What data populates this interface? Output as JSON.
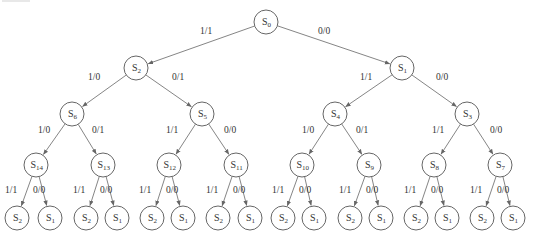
{
  "colors": {
    "stroke": "#666666",
    "edge": "#777777",
    "text": "#333333",
    "background": "#ffffff"
  },
  "node_radius": 12,
  "leaf_radius": 12,
  "nodes": [
    {
      "id": "n0",
      "base": "S",
      "sub": "0",
      "x": 266,
      "y": 22
    },
    {
      "id": "n1",
      "base": "S",
      "sub": "2",
      "x": 136,
      "y": 68
    },
    {
      "id": "n2",
      "base": "S",
      "sub": "1",
      "x": 402,
      "y": 68
    },
    {
      "id": "n3",
      "base": "S",
      "sub": "6",
      "x": 72,
      "y": 114
    },
    {
      "id": "n4",
      "base": "S",
      "sub": "5",
      "x": 202,
      "y": 114
    },
    {
      "id": "n5",
      "base": "S",
      "sub": "4",
      "x": 335,
      "y": 114
    },
    {
      "id": "n6",
      "base": "S",
      "sub": "3",
      "x": 467,
      "y": 114
    },
    {
      "id": "n7",
      "base": "S",
      "sub": "14",
      "x": 36,
      "y": 165
    },
    {
      "id": "n8",
      "base": "S",
      "sub": "13",
      "x": 103,
      "y": 165
    },
    {
      "id": "n9",
      "base": "S",
      "sub": "12",
      "x": 169,
      "y": 165
    },
    {
      "id": "n10",
      "base": "S",
      "sub": "11",
      "x": 236,
      "y": 165
    },
    {
      "id": "n11",
      "base": "S",
      "sub": "10",
      "x": 302,
      "y": 165
    },
    {
      "id": "n12",
      "base": "S",
      "sub": "9",
      "x": 369,
      "y": 165
    },
    {
      "id": "n13",
      "base": "S",
      "sub": "8",
      "x": 434,
      "y": 165
    },
    {
      "id": "n14",
      "base": "S",
      "sub": "7",
      "x": 500,
      "y": 165
    },
    {
      "id": "l0",
      "base": "S",
      "sub": "2",
      "x": 17,
      "y": 218
    },
    {
      "id": "l1",
      "base": "S",
      "sub": "1",
      "x": 50,
      "y": 218
    },
    {
      "id": "l2",
      "base": "S",
      "sub": "2",
      "x": 86,
      "y": 218
    },
    {
      "id": "l3",
      "base": "S",
      "sub": "1",
      "x": 117,
      "y": 218
    },
    {
      "id": "l4",
      "base": "S",
      "sub": "2",
      "x": 152,
      "y": 218
    },
    {
      "id": "l5",
      "base": "S",
      "sub": "1",
      "x": 183,
      "y": 218
    },
    {
      "id": "l6",
      "base": "S",
      "sub": "2",
      "x": 218,
      "y": 218
    },
    {
      "id": "l7",
      "base": "S",
      "sub": "1",
      "x": 250,
      "y": 218
    },
    {
      "id": "l8",
      "base": "S",
      "sub": "2",
      "x": 283,
      "y": 218
    },
    {
      "id": "l9",
      "base": "S",
      "sub": "1",
      "x": 314,
      "y": 218
    },
    {
      "id": "l10",
      "base": "S",
      "sub": "2",
      "x": 350,
      "y": 218
    },
    {
      "id": "l11",
      "base": "S",
      "sub": "1",
      "x": 381,
      "y": 218
    },
    {
      "id": "l12",
      "base": "S",
      "sub": "2",
      "x": 416,
      "y": 218
    },
    {
      "id": "l13",
      "base": "S",
      "sub": "1",
      "x": 447,
      "y": 218
    },
    {
      "id": "l14",
      "base": "S",
      "sub": "2",
      "x": 482,
      "y": 218
    },
    {
      "id": "l15",
      "base": "S",
      "sub": "1",
      "x": 513,
      "y": 218
    }
  ],
  "edges": [
    {
      "from": "n0",
      "to": "n1",
      "label": "1/1",
      "lx": 200,
      "ly": 34
    },
    {
      "from": "n0",
      "to": "n2",
      "label": "0/0",
      "lx": 318,
      "ly": 34
    },
    {
      "from": "n1",
      "to": "n3",
      "label": "1/0",
      "lx": 88,
      "ly": 80
    },
    {
      "from": "n1",
      "to": "n4",
      "label": "0/1",
      "lx": 172,
      "ly": 80
    },
    {
      "from": "n2",
      "to": "n5",
      "label": "1/1",
      "lx": 360,
      "ly": 80
    },
    {
      "from": "n2",
      "to": "n6",
      "label": "0/0",
      "lx": 436,
      "ly": 80
    },
    {
      "from": "n3",
      "to": "n7",
      "label": "1/0",
      "lx": 38,
      "ly": 133
    },
    {
      "from": "n3",
      "to": "n8",
      "label": "0/1",
      "lx": 92,
      "ly": 133
    },
    {
      "from": "n4",
      "to": "n9",
      "label": "1/1",
      "lx": 166,
      "ly": 133
    },
    {
      "from": "n4",
      "to": "n10",
      "label": "0/0",
      "lx": 224,
      "ly": 133
    },
    {
      "from": "n5",
      "to": "n11",
      "label": "1/0",
      "lx": 302,
      "ly": 133
    },
    {
      "from": "n5",
      "to": "n12",
      "label": "0/1",
      "lx": 356,
      "ly": 133
    },
    {
      "from": "n6",
      "to": "n13",
      "label": "1/1",
      "lx": 432,
      "ly": 133
    },
    {
      "from": "n6",
      "to": "n14",
      "label": "0/0",
      "lx": 490,
      "ly": 133
    },
    {
      "from": "n7",
      "to": "l0",
      "label": "1/1",
      "lx": 5,
      "ly": 193
    },
    {
      "from": "n7",
      "to": "l1",
      "label": "0/0",
      "lx": 33,
      "ly": 193
    },
    {
      "from": "n8",
      "to": "l2",
      "label": "1/1",
      "lx": 73,
      "ly": 193
    },
    {
      "from": "n8",
      "to": "l3",
      "label": "0/0",
      "lx": 100,
      "ly": 193
    },
    {
      "from": "n9",
      "to": "l4",
      "label": "1/1",
      "lx": 139,
      "ly": 193
    },
    {
      "from": "n9",
      "to": "l5",
      "label": "0/0",
      "lx": 166,
      "ly": 193
    },
    {
      "from": "n10",
      "to": "l6",
      "label": "1/1",
      "lx": 206,
      "ly": 193
    },
    {
      "from": "n10",
      "to": "l7",
      "label": "0/0",
      "lx": 233,
      "ly": 193
    },
    {
      "from": "n11",
      "to": "l8",
      "label": "1/1",
      "lx": 272,
      "ly": 193
    },
    {
      "from": "n11",
      "to": "l9",
      "label": "0/0",
      "lx": 299,
      "ly": 193
    },
    {
      "from": "n12",
      "to": "l10",
      "label": "1/1",
      "lx": 339,
      "ly": 193
    },
    {
      "from": "n12",
      "to": "l11",
      "label": "0/0",
      "lx": 366,
      "ly": 193
    },
    {
      "from": "n13",
      "to": "l12",
      "label": "1/1",
      "lx": 404,
      "ly": 193
    },
    {
      "from": "n13",
      "to": "l13",
      "label": "0/0",
      "lx": 431,
      "ly": 193
    },
    {
      "from": "n14",
      "to": "l14",
      "label": "1/1",
      "lx": 470,
      "ly": 193
    },
    {
      "from": "n14",
      "to": "l15",
      "label": "0/0",
      "lx": 497,
      "ly": 193
    }
  ]
}
